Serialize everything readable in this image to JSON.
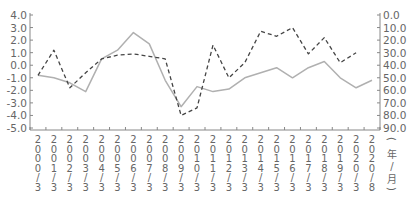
{
  "chart_data": {
    "type": "line",
    "title": "",
    "xlabel": "(年/月)",
    "ylabel_left": "",
    "ylabel_right": "",
    "categories": [
      "2000/3",
      "2001/3",
      "2002/3",
      "2003/3",
      "2004/3",
      "2005/3",
      "2006/3",
      "2007/3",
      "2008/3",
      "2009/3",
      "2010/3",
      "2011/3",
      "2012/3",
      "2013/3",
      "2014/3",
      "2015/3",
      "2016/3",
      "2017/3",
      "2018/3",
      "2019/3",
      "2020/3",
      "2020/8"
    ],
    "left_axis": {
      "ylim": [
        -5.0,
        4.0
      ],
      "ticks": [
        "4.0",
        "3.0",
        "2.0",
        "1.0",
        "0.0",
        "-1.0",
        "-2.0",
        "-3.0",
        "-4.0",
        "-5.0"
      ]
    },
    "right_axis": {
      "ylim": [
        90.0,
        0.0
      ],
      "inverted": true,
      "ticks": [
        "0.0",
        "10.0",
        "20.0",
        "30.0",
        "40.0",
        "50.0",
        "60.0",
        "70.0",
        "80.0",
        "90.0"
      ]
    },
    "series": [
      {
        "name": "series-solid",
        "axis": "left",
        "style": "solid",
        "color": "#b0b0b0",
        "values": [
          -0.8,
          -1.0,
          -1.4,
          -2.1,
          0.5,
          1.2,
          2.6,
          1.7,
          -1.2,
          -3.3,
          -1.7,
          -2.1,
          -1.9,
          -1.0,
          -0.6,
          -0.2,
          -1.0,
          -0.2,
          0.3,
          -1.0,
          -1.8,
          -1.2
        ]
      },
      {
        "name": "series-dashed",
        "axis": "right",
        "style": "dashed",
        "color": "#444444",
        "values": [
          48,
          28,
          58,
          46,
          35,
          32,
          31,
          33,
          35,
          80,
          74,
          24,
          50,
          38,
          13,
          17,
          10,
          31,
          18,
          38,
          30,
          null
        ]
      }
    ],
    "grid": false,
    "legend": "none"
  },
  "axis_unit_label": {
    "open": "(",
    "year": "年",
    "slash": "/",
    "month": "月",
    "close": ")"
  }
}
